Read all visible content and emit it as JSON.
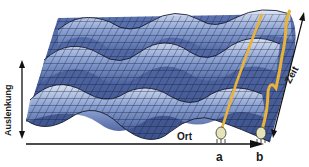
{
  "figure": {
    "type": "3d-wave-surface",
    "colors": {
      "surface_dark": "#3e5590",
      "surface_mid": "#6b85c2",
      "surface_light": "#c9d6ee",
      "grid_line": "#14162a",
      "worldline": "#e8b33a",
      "axis": "#111111"
    }
  },
  "axes": {
    "vertical": {
      "label": "Auslenkung",
      "arrow": "double"
    },
    "horizontal": {
      "label": "Ort",
      "arrow": "right"
    },
    "depth": {
      "label": "Zeit",
      "arrow": "double"
    }
  },
  "markers": [
    {
      "id": "a",
      "label": "a"
    },
    {
      "id": "b",
      "label": "b"
    }
  ]
}
